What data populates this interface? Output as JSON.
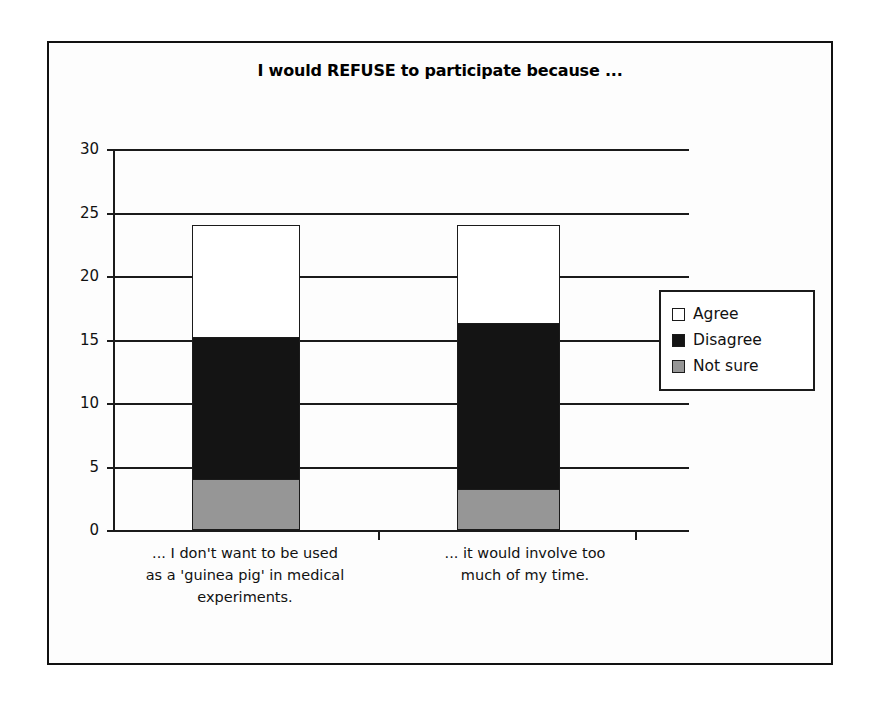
{
  "chart_data": {
    "type": "bar",
    "subtype": "stacked-column",
    "title": "I would REFUSE to participate because ...",
    "xlabel": "",
    "ylabel": "",
    "ylim": [
      0,
      30
    ],
    "yticks": [
      0,
      5,
      10,
      15,
      20,
      25,
      30
    ],
    "ytick_labels": [
      "0",
      "5",
      "10",
      "15",
      "20",
      "25",
      "30"
    ],
    "grid": true,
    "grid_axis": "y",
    "legend_position": "right",
    "categories": [
      "... I don't want to be used as a 'guinea pig' in medical experiments.",
      "... it would involve too much of my time."
    ],
    "category_lines": [
      [
        "... I don't want to be used",
        "as a 'guinea pig' in medical",
        "experiments."
      ],
      [
        "... it would involve too",
        "much of my time."
      ]
    ],
    "series": [
      {
        "name": "Not sure",
        "color": "#969696",
        "values": [
          4.0,
          3.2
        ]
      },
      {
        "name": "Disagree",
        "color": "#141414",
        "values": [
          11.2,
          13.1
        ]
      },
      {
        "name": "Agree",
        "color": "#ffffff",
        "values": [
          8.8,
          7.7
        ]
      }
    ],
    "totals": [
      24.0,
      24.0
    ]
  },
  "legend": {
    "items": [
      {
        "label": "Agree",
        "swatch": "white-square-icon",
        "color": "#ffffff"
      },
      {
        "label": "Disagree",
        "swatch": "black-square-icon",
        "color": "#141414"
      },
      {
        "label": "Not sure",
        "swatch": "gray-square-icon",
        "color": "#969696"
      }
    ]
  },
  "colors": {
    "frame": "#111111",
    "axis": "#1b1b1b",
    "background": "#fdfdfd",
    "agree": "#ffffff",
    "disagree": "#141414",
    "not_sure": "#969696"
  }
}
